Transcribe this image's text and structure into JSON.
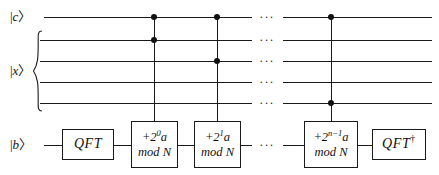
{
  "diagram": {
    "width": 439,
    "height": 175,
    "line_color": "#1a1a1a",
    "background": "#ffffff"
  },
  "registers": [
    {
      "id": "c",
      "label_bar": "|",
      "label_sym": "c",
      "label_ang": "〉",
      "y": 17
    },
    {
      "id": "x1",
      "label_bar": "",
      "label_sym": "",
      "label_ang": "",
      "y": 40
    },
    {
      "id": "x2",
      "label_bar": "",
      "label_sym": "",
      "label_ang": "",
      "y": 61
    },
    {
      "id": "x3",
      "label_bar": "",
      "label_sym": "",
      "label_ang": "",
      "y": 82
    },
    {
      "id": "x4",
      "label_bar": "",
      "label_sym": "",
      "label_ang": "",
      "y": 103
    },
    {
      "id": "b",
      "label_bar": "|",
      "label_sym": "b",
      "label_ang": "〉",
      "y": 145
    }
  ],
  "register_labels": {
    "c": {
      "bar": "|",
      "symbol": "c",
      "angle": "〉"
    },
    "x": {
      "bar": "|",
      "symbol": "x",
      "angle": "〉"
    },
    "b": {
      "bar": "|",
      "symbol": "b",
      "angle": "〉"
    }
  },
  "gates": [
    {
      "id": "qft",
      "name": "QFT",
      "label": "QFT",
      "dagger": "",
      "x": 62,
      "y": 129,
      "width": 52,
      "height": 31
    },
    {
      "id": "add0",
      "name": "controlled-add-2^0-a-mod-N",
      "line1_prefix": "+2",
      "line1_exp": "0",
      "line1_suffix": "a",
      "line2": "mod N",
      "x": 131,
      "y": 121,
      "width": 47,
      "height": 47
    },
    {
      "id": "add1",
      "name": "controlled-add-2^1-a-mod-N",
      "line1_prefix": "+2",
      "line1_exp": "1",
      "line1_suffix": "a",
      "line2": "mod N",
      "x": 194,
      "y": 121,
      "width": 47,
      "height": 47
    },
    {
      "id": "addn",
      "name": "controlled-add-2^n-1-a-mod-N",
      "line1_prefix": "+2",
      "line1_exp": "n−1",
      "line1_suffix": "a",
      "line2": "mod N",
      "x": 304,
      "y": 121,
      "width": 54,
      "height": 47
    },
    {
      "id": "qft-dag",
      "name": "QFT-dagger",
      "label": "QFT",
      "dagger": "†",
      "x": 372,
      "y": 129,
      "width": 54,
      "height": 31
    }
  ],
  "controls": [
    {
      "gate": "add0",
      "x": 154,
      "targets": [
        "c",
        "x1"
      ],
      "top_y": 17,
      "bottom_y": 121
    },
    {
      "gate": "add1",
      "x": 217,
      "targets": [
        "c",
        "x2"
      ],
      "top_y": 17,
      "bottom_y": 121
    },
    {
      "gate": "addn",
      "x": 331,
      "targets": [
        "c",
        "x4"
      ],
      "top_y": 17,
      "bottom_y": 121
    }
  ],
  "ellipsis": {
    "glyph": "···",
    "x": 267,
    "rows": [
      17,
      40,
      61,
      82,
      103,
      145
    ]
  },
  "wire_segments": {
    "left_start": 44,
    "x_register_start": 40,
    "right_end": 432,
    "break_left": 252,
    "break_right": 283
  },
  "brace": {
    "name": "x-register-brace",
    "x": 32,
    "y": 30,
    "width": 10,
    "height": 82
  }
}
